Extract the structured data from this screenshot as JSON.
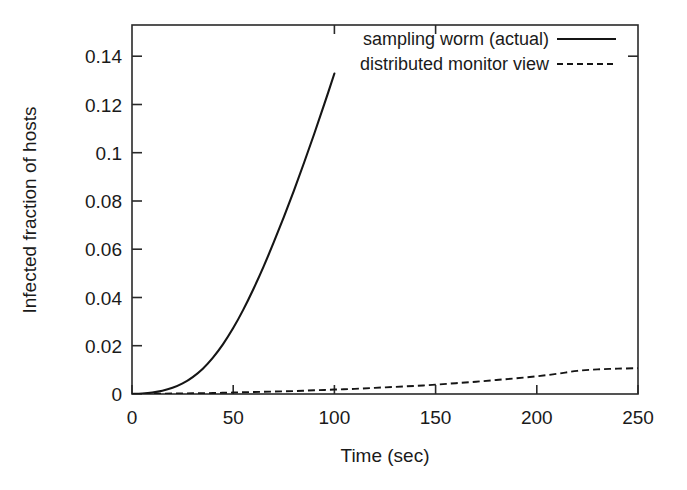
{
  "chart_data": {
    "type": "line",
    "title": "",
    "xlabel": "Time (sec)",
    "ylabel": "Infected fraction of hosts",
    "xlim": [
      0,
      250
    ],
    "ylim": [
      0,
      0.15
    ],
    "grid": false,
    "legend_position": "top-center-right",
    "xticks": [
      0,
      50,
      100,
      150,
      200,
      250
    ],
    "xtick_labels": [
      "0",
      "50",
      "100",
      "150",
      "200",
      "250"
    ],
    "yticks": [
      0,
      0.02,
      0.04,
      0.06,
      0.08,
      0.1,
      0.12,
      0.14
    ],
    "ytick_labels": [
      "0",
      "0.02",
      "0.04",
      "0.06",
      "0.08",
      "0.1",
      "0.12",
      "0.14"
    ],
    "x": [
      0,
      5,
      10,
      15,
      20,
      25,
      30,
      35,
      40,
      45,
      50,
      55,
      60,
      65,
      70,
      75,
      80,
      85,
      90,
      95,
      100
    ],
    "series": [
      {
        "name": "sampling worm (actual)",
        "style": "solid",
        "color": "#151515",
        "values": [
          0.0,
          0.0002,
          0.0006,
          0.0013,
          0.0025,
          0.0043,
          0.0069,
          0.0103,
          0.0148,
          0.0203,
          0.0268,
          0.0343,
          0.0427,
          0.0518,
          0.0616,
          0.0719,
          0.0827,
          0.094,
          0.1057,
          0.1178,
          0.1303
        ]
      },
      {
        "name": "distributed monitor view",
        "style": "dashed",
        "color": "#151515",
        "x": [
          0,
          10,
          20,
          30,
          40,
          50,
          60,
          70,
          80,
          90,
          100,
          110,
          120,
          130,
          140,
          150,
          160,
          170,
          180,
          190,
          200,
          210,
          220,
          230,
          240,
          250
        ],
        "values": [
          0.0,
          0.0001,
          0.0002,
          0.0003,
          0.0004,
          0.0006,
          0.0008,
          0.001,
          0.0012,
          0.0015,
          0.0018,
          0.0021,
          0.0025,
          0.0029,
          0.0033,
          0.0038,
          0.0044,
          0.005,
          0.0057,
          0.0064,
          0.0072,
          0.0082,
          0.0094,
          0.01,
          0.0103,
          0.0105
        ]
      }
    ]
  },
  "legend": {
    "entries": [
      {
        "label": "sampling worm (actual)",
        "style": "solid"
      },
      {
        "label": "distributed monitor view",
        "style": "dashed"
      }
    ]
  }
}
